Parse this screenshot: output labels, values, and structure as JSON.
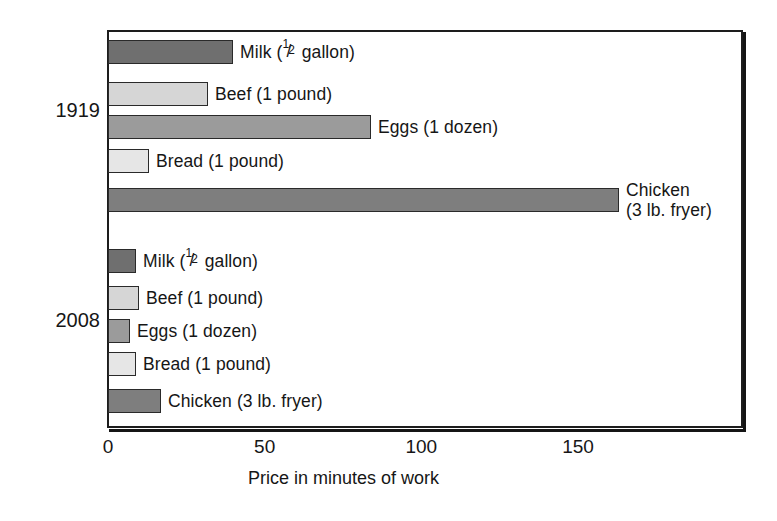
{
  "chart": {
    "type": "bar",
    "orientation": "horizontal",
    "title": "",
    "xlabel": "Price in minutes of work",
    "ylabel": "",
    "xlim": [
      0,
      203
    ],
    "xticks": [
      0,
      50,
      100,
      150
    ],
    "xtick_labels": [
      "0",
      "50",
      "100",
      "150"
    ],
    "grid": false,
    "legend": false,
    "group_labels": [
      "1919",
      "2008"
    ]
  },
  "chart_data": {
    "type": "bar",
    "orientation": "horizontal",
    "title": "",
    "xlabel": "Price in minutes of work",
    "ylabel": "",
    "xlim": [
      0,
      203
    ],
    "xticks": [
      0,
      50,
      100,
      150
    ],
    "xtick_labels": [
      "0",
      "50",
      "100",
      "150"
    ],
    "grid": false,
    "legend": false,
    "legend_position": "none",
    "categories": [
      "Milk (1/2 gallon)",
      "Beef (1 pound)",
      "Eggs (1 dozen)",
      "Bread (1 pound)",
      "Chicken (3 lb. fryer)"
    ],
    "series": [
      {
        "name": "1919",
        "values": [
          40,
          32,
          84,
          13,
          163
        ]
      },
      {
        "name": "2008",
        "values": [
          9,
          10,
          7,
          9,
          17
        ]
      }
    ],
    "colors": {
      "milk": "#6f6f6f",
      "beef": "#d6d6d6",
      "eggs": "#9b9b9b",
      "bread": "#e6e6e6",
      "chicken": "#7e7e7e",
      "outline": "#2a2a2a",
      "frame": "#1d1d1d",
      "text": "#161616"
    }
  },
  "groups": [
    {
      "year": "1919",
      "bars": [
        {
          "item": "milk",
          "value": 40,
          "label_prefix": "Milk (",
          "label_suffix": " gallon)",
          "has_fraction": true,
          "fraction_num": "1",
          "fraction_den": "2",
          "label": "Milk (1/2 gallon)",
          "color": "#6f6f6f"
        },
        {
          "item": "beef",
          "value": 32,
          "label": "Beef (1 pound)",
          "has_fraction": false,
          "color": "#d6d6d6"
        },
        {
          "item": "eggs",
          "value": 84,
          "label": "Eggs (1 dozen)",
          "has_fraction": false,
          "color": "#9b9b9b"
        },
        {
          "item": "bread",
          "value": 13,
          "label": "Bread (1 pound)",
          "has_fraction": false,
          "color": "#e6e6e6"
        },
        {
          "item": "chicken",
          "value": 163,
          "label_line1": "Chicken",
          "label_line2": "(3 lb. fryer)",
          "label": "Chicken (3 lb. fryer)",
          "has_fraction": false,
          "color": "#7e7e7e"
        }
      ]
    },
    {
      "year": "2008",
      "bars": [
        {
          "item": "milk",
          "value": 9,
          "label_prefix": "Milk (",
          "label_suffix": " gallon)",
          "has_fraction": true,
          "fraction_num": "1",
          "fraction_den": "2",
          "label": "Milk (1/2 gallon)",
          "color": "#6f6f6f"
        },
        {
          "item": "beef",
          "value": 10,
          "label": "Beef (1 pound)",
          "has_fraction": false,
          "color": "#d6d6d6"
        },
        {
          "item": "eggs",
          "value": 7,
          "label": "Eggs (1 dozen)",
          "has_fraction": false,
          "color": "#9b9b9b"
        },
        {
          "item": "bread",
          "value": 9,
          "label": "Bread (1 pound)",
          "has_fraction": false,
          "color": "#e6e6e6"
        },
        {
          "item": "chicken",
          "value": 17,
          "label": "Chicken (3 lb. fryer)",
          "has_fraction": false,
          "color": "#7e7e7e"
        }
      ]
    }
  ],
  "axis": {
    "ticks": [
      {
        "value": 0,
        "label": "0"
      },
      {
        "value": 50,
        "label": "50"
      },
      {
        "value": 100,
        "label": "100"
      },
      {
        "value": 150,
        "label": "150"
      }
    ],
    "title": "Price in minutes of work"
  }
}
